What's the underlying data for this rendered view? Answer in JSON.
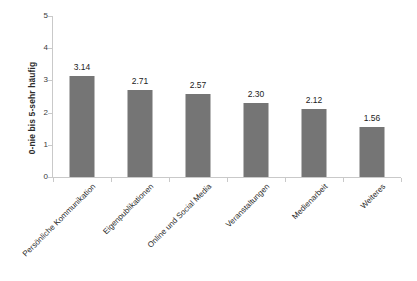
{
  "chart_data": {
    "type": "bar",
    "title": "",
    "subtitle": "",
    "xlabel": "",
    "ylabel": "0-nie bis 5-sehr häufig",
    "categories": [
      "Persönliche Kommunikation",
      "Eigenpublikationen",
      "Online und Social Media",
      "Veranstaltungen",
      "Medienarbeit",
      "Weiteres"
    ],
    "values": [
      3.14,
      2.71,
      2.57,
      2.3,
      2.12,
      1.56
    ],
    "value_labels": [
      "3.14",
      "2.71",
      "2.57",
      "2.30",
      "2.12",
      "1.56"
    ],
    "ylim": [
      0,
      5
    ],
    "yticks": [
      0,
      1,
      2,
      3,
      4,
      5
    ],
    "ytick_labels": [
      "0",
      "1",
      "2",
      "3",
      "4",
      "5"
    ],
    "grid": false,
    "legend": null,
    "legend_position": "none",
    "series": [
      {
        "name": "",
        "values": [
          3.14,
          2.71,
          2.57,
          2.3,
          2.12,
          1.56
        ]
      }
    ],
    "colors": {
      "bar": "#757575",
      "axis": "#c9c9c9",
      "text": "#2b2b2b",
      "value_text": "#1c1c1c",
      "background": "#ffffff"
    }
  }
}
